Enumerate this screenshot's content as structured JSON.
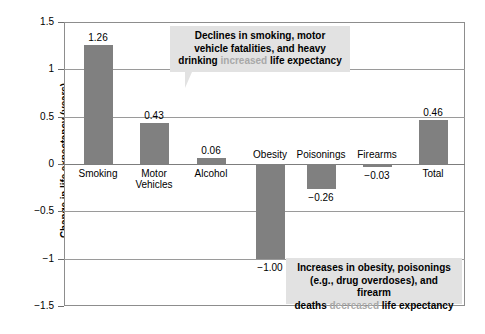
{
  "chart_data": {
    "type": "bar",
    "title": "",
    "xlabel": "",
    "ylabel": "Change in life expectancy (years)",
    "ylim": [
      -1.5,
      1.5
    ],
    "ytick_labels": [
      "1.5",
      "1",
      "0.5",
      "0",
      "-0.5",
      "-1",
      "-1.5"
    ],
    "ytick_values": [
      1.5,
      1,
      0.5,
      0,
      -0.5,
      -1,
      -1.5
    ],
    "grid": true,
    "legend": "none",
    "bar_color": "#808080",
    "categories": [
      "Smoking",
      "Motor\nVehicles",
      "Alcohol",
      "Obesity",
      "Poisonings",
      "Firearms",
      "Total"
    ],
    "values": [
      1.26,
      0.43,
      0.06,
      -1.0,
      -0.26,
      -0.03,
      0.46
    ],
    "value_labels": [
      "1.26",
      "0.43",
      "0.06",
      "−1.00",
      "−0.26",
      "−0.03",
      "0.46"
    ],
    "annotations": [
      {
        "id": "positive-factors",
        "position": "top",
        "lines": [
          [
            {
              "text": "Declines in smoking, motor",
              "style": "normal"
            }
          ],
          [
            {
              "text": "vehicle fatalities, and heavy",
              "style": "normal"
            }
          ],
          [
            {
              "text": "drinking ",
              "style": "normal"
            },
            {
              "text": "increased",
              "style": "muted"
            },
            {
              "text": " life expectancy",
              "style": "normal"
            }
          ]
        ]
      },
      {
        "id": "negative-factors",
        "position": "bottom",
        "lines": [
          [
            {
              "text": "Increases in obesity, poisonings",
              "style": "normal"
            }
          ],
          [
            {
              "text": "(e.g., drug overdoses), and firearm",
              "style": "normal"
            }
          ],
          [
            {
              "text": "deaths ",
              "style": "normal"
            },
            {
              "text": "decreased",
              "style": "muted"
            },
            {
              "text": " life expectancy",
              "style": "normal"
            }
          ]
        ]
      }
    ]
  },
  "axis": {
    "y_title": "Change in life expectancy (years)"
  },
  "colors": {
    "bar": "#808080",
    "grid": "#9a9a9a",
    "frame": "#8d8d8d",
    "callout_bg": "#e2e2e2",
    "muted_text": "#a8a8a8"
  }
}
